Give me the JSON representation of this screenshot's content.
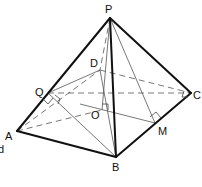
{
  "diagram": {
    "vertices": {
      "P": {
        "label": "P",
        "x": 110,
        "y": 18,
        "lx": 105,
        "ly": 13
      },
      "A": {
        "label": "A",
        "x": 17,
        "y": 131,
        "lx": 5,
        "ly": 140
      },
      "B": {
        "label": "B",
        "x": 116,
        "y": 157,
        "lx": 112,
        "ly": 171
      },
      "C": {
        "label": "C",
        "x": 191,
        "y": 93,
        "lx": 193,
        "ly": 99
      },
      "D": {
        "label": "D",
        "x": 100,
        "y": 70,
        "lx": 90,
        "ly": 67
      },
      "O": {
        "label": "O",
        "x": 102,
        "y": 110,
        "lx": 91,
        "ly": 119
      },
      "Q": {
        "label": "Q",
        "x": 48,
        "y": 93,
        "lx": 35,
        "ly": 96
      },
      "M": {
        "label": "M",
        "x": 155,
        "y": 123,
        "lx": 158,
        "ly": 135
      }
    },
    "fragment_text": "d",
    "edges_solid": [
      "PA",
      "PB",
      "PC",
      "AB",
      "BC"
    ],
    "edges_dashed": [
      "PD",
      "AD",
      "DC",
      "QC",
      "AC"
    ],
    "edges_thin": [
      "PO",
      "PM",
      "QB",
      "QO",
      "OM",
      "DB"
    ],
    "right_angle_marks": [
      "Q",
      "O",
      "M",
      "C"
    ],
    "colors": {
      "line": "#111111",
      "thin": "#555555",
      "background": "#ffffff"
    }
  }
}
